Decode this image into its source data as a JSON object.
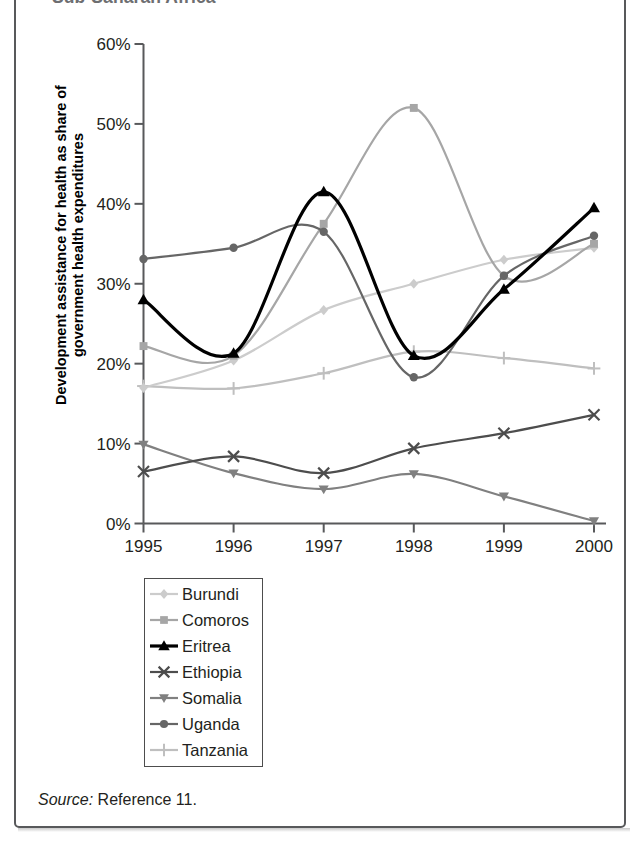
{
  "figure": {
    "title": "Sub-Saharan Africa",
    "source_prefix": "Source:",
    "source_text": "Reference 11."
  },
  "axes": {
    "y_label_line1": "Development assistance for health as share of",
    "y_label_line2": "government health expenditures",
    "y_ticks": [
      "0%",
      "10%",
      "20%",
      "30%",
      "40%",
      "50%",
      "60%"
    ],
    "x_ticks": [
      "1995",
      "1996",
      "1997",
      "1998",
      "1999",
      "2000"
    ]
  },
  "legend": {
    "items": [
      {
        "label": "Burundi",
        "marker": "diamond-marker",
        "color": "#cccccc"
      },
      {
        "label": "Comoros",
        "marker": "square-marker",
        "color": "#a6a6a6"
      },
      {
        "label": "Eritrea",
        "marker": "triangle-up-marker",
        "color": "#000000"
      },
      {
        "label": "Ethiopia",
        "marker": "x-cross-marker",
        "color": "#4d4d4d"
      },
      {
        "label": "Somalia",
        "marker": "triangle-down-marker",
        "color": "#808080"
      },
      {
        "label": "Uganda",
        "marker": "circle-marker",
        "color": "#666666"
      },
      {
        "label": "Tanzania",
        "marker": "plus-marker",
        "color": "#bfbfbf"
      }
    ]
  },
  "chart_data": {
    "type": "line",
    "title": "Sub-Saharan Africa",
    "xlabel": "",
    "ylabel": "Development assistance for health as share of government health expenditures",
    "x": [
      1995,
      1996,
      1997,
      1998,
      1999,
      2000
    ],
    "xlim": [
      1995,
      2000
    ],
    "ylim": [
      0,
      60
    ],
    "y_unit": "percent",
    "y_tick_values": [
      0,
      10,
      20,
      30,
      40,
      50,
      60
    ],
    "grid": false,
    "legend_position": "below-plot",
    "smoothing": "spline",
    "series": [
      {
        "name": "Burundi",
        "color": "#cccccc",
        "marker": "diamond",
        "values": [
          17.0,
          20.4,
          26.7,
          30.0,
          33.0,
          34.5
        ]
      },
      {
        "name": "Comoros",
        "color": "#a6a6a6",
        "marker": "square",
        "values": [
          22.2,
          21.0,
          37.5,
          52.0,
          31.0,
          35.0
        ]
      },
      {
        "name": "Eritrea",
        "color": "#000000",
        "marker": "triangle-up",
        "values": [
          28.0,
          21.3,
          41.5,
          21.0,
          29.3,
          39.5
        ]
      },
      {
        "name": "Ethiopia",
        "color": "#4d4d4d",
        "marker": "x-cross",
        "values": [
          6.5,
          8.4,
          6.3,
          9.4,
          11.3,
          13.6
        ]
      },
      {
        "name": "Somalia",
        "color": "#808080",
        "marker": "triangle-down",
        "values": [
          9.9,
          6.3,
          4.3,
          6.2,
          3.4,
          0.3
        ]
      },
      {
        "name": "Uganda",
        "color": "#666666",
        "marker": "circle",
        "values": [
          33.1,
          34.5,
          36.5,
          18.3,
          31.0,
          36.0
        ]
      },
      {
        "name": "Tanzania",
        "color": "#bfbfbf",
        "marker": "plus",
        "values": [
          17.2,
          16.9,
          18.8,
          21.5,
          20.7,
          19.4
        ]
      }
    ]
  }
}
